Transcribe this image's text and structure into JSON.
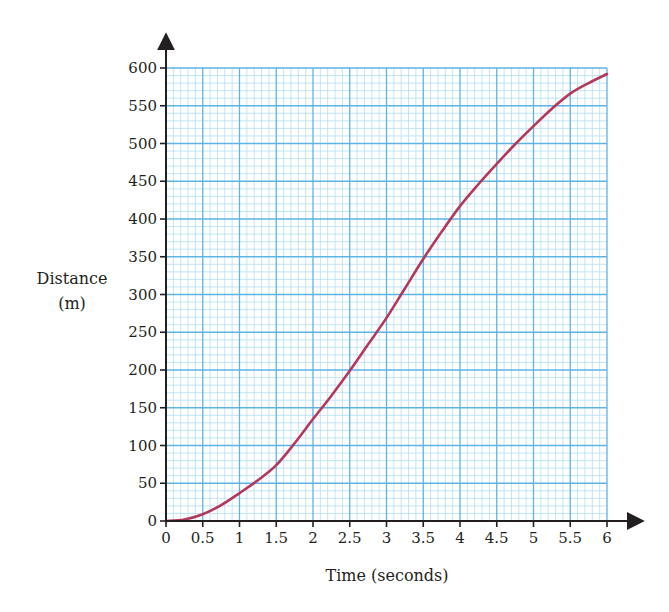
{
  "chart_data": {
    "type": "line",
    "title": "",
    "xlabel": "Time (seconds)",
    "ylabel": "Distance (m)",
    "ylabel_lines": [
      "Distance",
      "(m)"
    ],
    "xlim": [
      0,
      6
    ],
    "ylim": [
      0,
      600
    ],
    "x_ticks": [
      0,
      0.5,
      1,
      1.5,
      2,
      2.5,
      3,
      3.5,
      4,
      4.5,
      5,
      5.5,
      6
    ],
    "x_tick_labels": [
      "0",
      "0.5",
      "1",
      "1.5",
      "2",
      "2.5",
      "3",
      "3.5",
      "4",
      "4.5",
      "5",
      "5.5",
      "6"
    ],
    "y_ticks": [
      0,
      50,
      100,
      150,
      200,
      250,
      300,
      350,
      400,
      450,
      500,
      550,
      600
    ],
    "y_tick_labels": [
      "0",
      "50",
      "100",
      "150",
      "200",
      "250",
      "300",
      "350",
      "400",
      "450",
      "500",
      "550",
      "600"
    ],
    "grid": {
      "on": true,
      "major_x": 0.5,
      "major_y": 50,
      "minor_x": 0.1,
      "minor_y": 10
    },
    "legend": null,
    "series": [
      {
        "name": "Distance",
        "color": "#b5375a",
        "x": [
          0,
          0.25,
          0.5,
          0.75,
          1,
          1.25,
          1.5,
          1.75,
          2,
          2.25,
          2.5,
          2.75,
          3,
          3.25,
          3.5,
          3.75,
          4,
          4.25,
          4.5,
          4.75,
          5,
          5.25,
          5.5,
          5.75,
          6
        ],
        "y": [
          0,
          2,
          9,
          21,
          37,
          54,
          74,
          103,
          135,
          166,
          199,
          234,
          269,
          308,
          347,
          383,
          417,
          446,
          473,
          499,
          523,
          546,
          566,
          580,
          592
        ]
      }
    ]
  },
  "colors": {
    "major_grid": "#5db3e4",
    "minor_grid": "#b3def3",
    "axis": "#231f20",
    "curve": "#b5375a"
  }
}
